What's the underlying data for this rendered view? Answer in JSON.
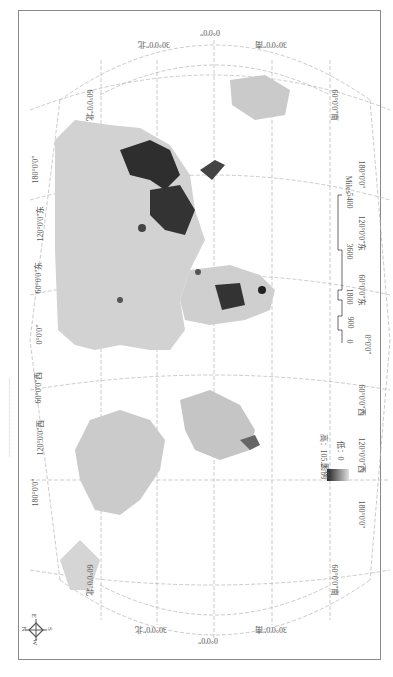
{
  "map": {
    "title": "——————————",
    "orientation": "rotated 90° clockwise (north to the left)",
    "colors": {
      "frame": "#8a8a8a",
      "grid": "#b5b5b5",
      "land_low": "#d8d8d8",
      "land_mid": "#b9b9b9",
      "land_high": "#2a2a2a",
      "water": "#ffffff"
    },
    "longitude_labels_left": [
      "180°0'0\"",
      "120°0'0\"东",
      "60°0'0\"东",
      "0°0'0\"",
      "60°0'0\"西",
      "120°0'0\"西",
      "180°0'0\""
    ],
    "longitude_labels_right": [
      "180°0'0\"",
      "120°0'0\"东",
      "60°0'0\"东",
      "0°0'0\"",
      "60°0'0\"西",
      "120°0'0\"西",
      "180°0'0\""
    ],
    "latitude_labels_top": [
      "30°0'0\"北",
      "0°0'0\"",
      "30°0'0\"南"
    ],
    "latitude_labels_bottom": [
      "30°0'0\"北",
      "0°0'0\"",
      "30°0'0\"南"
    ],
    "latitude_labels_side": {
      "top_left": "60°0'0\"北",
      "top_right": "60°0'0\"南",
      "bottom_left": "60°0'0\"北",
      "bottom_right": "60°0'0\"南"
    },
    "legend": {
      "title": "图例",
      "high_label": "高：105.2",
      "low_label": "低：0",
      "high_value": 105.2,
      "low_value": 0
    },
    "scale_bar": {
      "ticks": [
        "0",
        "900",
        "1800",
        "3600",
        "5400"
      ],
      "unit": "Miles"
    },
    "compass": {
      "n": "N",
      "s": "S",
      "e": "E",
      "w": "W"
    }
  }
}
